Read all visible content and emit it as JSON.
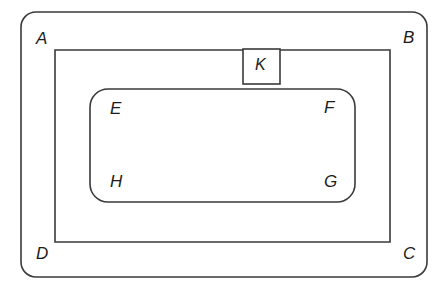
{
  "diagram": {
    "background_color": "#ffffff",
    "stroke_color": "#3a3a3a",
    "label_color": "#1c1c1c",
    "shapes": [
      {
        "id": "outer-rounded-rect",
        "name": "outer-rounded-rectangle",
        "shape": "rounded-rectangle",
        "x": 21,
        "y": 12,
        "width": 406,
        "height": 265,
        "corner_radius": 15,
        "corner_labels": [
          "A",
          "B",
          "C",
          "D"
        ]
      },
      {
        "id": "middle-rect",
        "name": "middle-rectangle",
        "shape": "rectangle",
        "x": 55,
        "y": 50,
        "width": 335,
        "height": 192,
        "corner_radius": 0,
        "corner_labels": []
      },
      {
        "id": "inner-rounded-rect",
        "name": "inner-rounded-rectangle",
        "shape": "rounded-rectangle",
        "x": 90,
        "y": 89,
        "width": 265,
        "height": 113,
        "corner_radius": 18,
        "corner_labels": [
          "E",
          "F",
          "G",
          "H"
        ]
      },
      {
        "id": "k-box",
        "name": "k-box",
        "shape": "rectangle",
        "x": 243,
        "y": 49,
        "width": 37,
        "height": 35,
        "corner_radius": 0,
        "corner_labels": [
          "K"
        ]
      }
    ],
    "labels": [
      {
        "id": "label-a",
        "text": "A",
        "x": 36,
        "y": 30,
        "belongs_to": "outer-rounded-rect",
        "position": "top-left"
      },
      {
        "id": "label-b",
        "text": "B",
        "x": 403,
        "y": 29,
        "belongs_to": "outer-rounded-rect",
        "position": "top-right"
      },
      {
        "id": "label-c",
        "text": "C",
        "x": 403,
        "y": 245,
        "belongs_to": "outer-rounded-rect",
        "position": "bottom-right"
      },
      {
        "id": "label-d",
        "text": "D",
        "x": 36,
        "y": 245,
        "belongs_to": "outer-rounded-rect",
        "position": "bottom-left"
      },
      {
        "id": "label-e",
        "text": "E",
        "x": 110,
        "y": 100,
        "belongs_to": "inner-rounded-rect",
        "position": "top-left"
      },
      {
        "id": "label-f",
        "text": "F",
        "x": 324,
        "y": 99,
        "belongs_to": "inner-rounded-rect",
        "position": "top-right"
      },
      {
        "id": "label-g",
        "text": "G",
        "x": 324,
        "y": 173,
        "belongs_to": "inner-rounded-rect",
        "position": "bottom-right"
      },
      {
        "id": "label-h",
        "text": "H",
        "x": 110,
        "y": 173,
        "belongs_to": "inner-rounded-rect",
        "position": "bottom-left"
      },
      {
        "id": "label-k",
        "text": "K",
        "x": 255,
        "y": 57,
        "belongs_to": "k-box",
        "position": "center"
      }
    ]
  }
}
